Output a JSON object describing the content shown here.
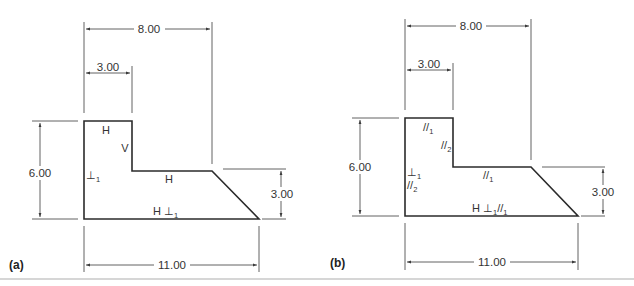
{
  "figure": {
    "panels": [
      {
        "label": "(a)",
        "dimensions": {
          "top_overall": "8.00",
          "top_step": "3.00",
          "left_height": "6.00",
          "right_height": "3.00",
          "bottom_width": "11.00"
        },
        "constraints": {
          "top_edge": "H",
          "notch_vertical": "V",
          "mid_horizontal": "H",
          "left_edge_symbol": "⊥",
          "left_edge_sub": "1",
          "bottom_edge_main": "H ⊥",
          "bottom_edge_sub": "1"
        }
      },
      {
        "label": "(b)",
        "dimensions": {
          "top_overall": "8.00",
          "top_step": "3.00",
          "left_height": "6.00",
          "right_height": "3.00",
          "bottom_width": "11.00"
        },
        "constraints": {
          "top_edge_symbol": "//",
          "top_edge_sub": "1",
          "notch_vertical_symbol": "//",
          "notch_vertical_sub": "2",
          "mid_horizontal_symbol": "//",
          "mid_horizontal_sub": "1",
          "left_edge_perp": "⊥",
          "left_edge_perp_sub": "1",
          "left_edge_par": "//",
          "left_edge_par_sub": "2",
          "bottom_edge_h": "H ⊥",
          "bottom_edge_perp_sub": "1",
          "bottom_edge_par": "//",
          "bottom_edge_par_sub": "1"
        }
      }
    ]
  },
  "colors": {
    "line": "#2b2b2b",
    "text": "#333333",
    "separator": "#d6d6d6",
    "background": "#ffffff"
  }
}
